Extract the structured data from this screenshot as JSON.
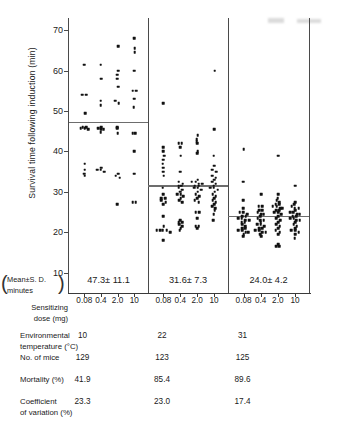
{
  "figure": {
    "ylabel": "Survival time following induction (min)",
    "y_axis": {
      "ticks": [
        70,
        60,
        50,
        40,
        30,
        20,
        10
      ],
      "min": 5,
      "max": 73
    },
    "x_axis": {
      "label_line1": "Sensitizing",
      "label_line2": "dose (mg)",
      "tick_labels": [
        "0.08",
        "0.4",
        "2.0",
        "10"
      ]
    },
    "mean_caption_line1": "Mean±S. D.",
    "mean_caption_line2": "minutes",
    "paren_left": "(",
    "paren_right": ")",
    "panels": [
      {
        "name": "10C",
        "mean_sd": "47.3± 11.1",
        "mean_value": 47.3
      },
      {
        "name": "22C",
        "mean_sd": "31.6± 7.3",
        "mean_value": 31.6
      },
      {
        "name": "31C",
        "mean_sd": "24.0± 4.2",
        "mean_value": 24.0
      }
    ]
  },
  "stats_table": {
    "rows": [
      {
        "label_line1": "Environmental",
        "label_line2": "temperature (°C)",
        "values": [
          "10",
          "22",
          "31"
        ]
      },
      {
        "label_line1": "No. of mice",
        "label_line2": "",
        "values": [
          "129",
          "123",
          "125"
        ]
      },
      {
        "label_line1": "Mortality (%)",
        "label_line2": "",
        "values": [
          "41.9",
          "85.4",
          "89.6"
        ]
      },
      {
        "label_line1": "Coefficient",
        "label_line2": "of variation (%)",
        "values": [
          "23.3",
          "23.0",
          "17.4"
        ]
      }
    ]
  },
  "chart_data": {
    "type": "scatter",
    "title": "",
    "xlabel": "Sensitizing dose (mg)",
    "ylabel": "Survival time following induction (min)",
    "ylim": [
      5,
      73
    ],
    "grid": false,
    "legend": "none",
    "groups": [
      {
        "environmental_temperature_C": 10,
        "mean": 47.3,
        "sd": 11.1,
        "n_mice": 129,
        "mortality_pct": 41.9,
        "cv_pct": 23.3,
        "doses": [
          {
            "dose_mg": 0.08,
            "values": [
              61.5,
              54.0,
              54.0,
              49.5,
              46.0,
              46.0,
              45.8,
              45.8,
              45.5,
              37.0,
              35.5,
              34.5,
              34.0
            ]
          },
          {
            "dose_mg": 0.4,
            "values": [
              61.5,
              58.0,
              52.5,
              51.5,
              46.0,
              45.8,
              45.5,
              45.5,
              44.8,
              36.0,
              35.5,
              35.5,
              35.0
            ]
          },
          {
            "dose_mg": 2.0,
            "values": [
              66.0,
              60.0,
              59.0,
              58.0,
              56.0,
              52.5,
              52.0,
              46.0,
              45.8,
              44.5,
              34.5,
              34.0,
              33.5,
              27.0
            ]
          },
          {
            "dose_mg": 10,
            "values": [
              68.0,
              65.5,
              64.5,
              60.0,
              55.0,
              55.0,
              53.0,
              51.0,
              44.5,
              44.5,
              40.0,
              34.5,
              27.5,
              27.5
            ]
          }
        ]
      },
      {
        "environmental_temperature_C": 22,
        "mean": 31.6,
        "sd": 7.3,
        "n_mice": 123,
        "mortality_pct": 85.4,
        "cv_pct": 23.0,
        "doses": [
          {
            "dose_mg": 0.08,
            "values": [
              52.0,
              41.0,
              40.0,
              39.0,
              38.0,
              37.0,
              36.0,
              35.0,
              34.0,
              31.0,
              29.5,
              28.5,
              28.5,
              28.0,
              27.5,
              27.0,
              24.0,
              21.5,
              20.5,
              20.5,
              20.5,
              20.5,
              20.0,
              18.0
            ]
          },
          {
            "dose_mg": 0.4,
            "values": [
              42.0,
              42.0,
              41.0,
              39.0,
              35.0,
              32.5,
              32.0,
              31.5,
              31.5,
              31.0,
              30.5,
              30.0,
              29.5,
              29.5,
              29.0,
              28.5,
              28.0,
              27.5,
              23.0,
              22.5,
              22.5,
              22.0,
              21.5,
              21.0,
              20.5
            ]
          },
          {
            "dose_mg": 2.0,
            "values": [
              44.0,
              43.0,
              42.5,
              42.0,
              40.0,
              39.5,
              33.0,
              32.5,
              32.5,
              32.0,
              32.0,
              31.5,
              31.5,
              31.0,
              31.0,
              30.5,
              30.0,
              29.5,
              29.0,
              28.5,
              28.0,
              27.5,
              25.0,
              25.0,
              23.5,
              21.5,
              21.5,
              21.0
            ]
          },
          {
            "dose_mg": 10,
            "values": [
              60.0,
              45.5,
              39.0,
              36.5,
              35.5,
              35.0,
              34.0,
              33.5,
              33.0,
              32.5,
              32.0,
              31.5,
              31.0,
              31.0,
              30.5,
              30.0,
              29.5,
              29.0,
              28.5,
              28.0,
              27.5,
              27.0,
              26.5,
              26.0,
              25.5,
              24.5,
              23.0
            ]
          }
        ]
      },
      {
        "environmental_temperature_C": 31,
        "mean": 24.0,
        "sd": 4.2,
        "n_mice": 125,
        "mortality_pct": 89.6,
        "cv_pct": 17.4,
        "doses": [
          {
            "dose_mg": 0.08,
            "values": [
              40.5,
              32.5,
              28.0,
              26.0,
              25.0,
              25.0,
              24.5,
              24.0,
              24.0,
              23.5,
              23.5,
              23.0,
              23.0,
              22.5,
              22.5,
              22.0,
              21.5,
              21.0,
              21.0,
              20.5,
              20.5,
              20.0,
              20.0,
              19.5,
              19.0
            ]
          },
          {
            "dose_mg": 0.4,
            "values": [
              29.5,
              26.5,
              26.5,
              25.5,
              25.5,
              25.0,
              24.5,
              24.5,
              24.0,
              23.5,
              23.0,
              23.0,
              22.5,
              22.0,
              22.0,
              21.5,
              21.0,
              21.0,
              20.5,
              20.5,
              20.0,
              20.0,
              19.5,
              19.0
            ]
          },
          {
            "dose_mg": 2.0,
            "values": [
              39.0,
              29.5,
              28.5,
              28.0,
              27.5,
              27.0,
              27.0,
              26.5,
              26.5,
              26.0,
              26.0,
              25.5,
              25.5,
              25.0,
              25.0,
              24.5,
              24.0,
              23.5,
              23.0,
              22.5,
              22.0,
              21.5,
              21.0,
              20.5,
              20.0,
              19.5,
              17.0,
              16.5,
              16.5
            ]
          },
          {
            "dose_mg": 10,
            "values": [
              31.5,
              27.5,
              27.0,
              26.5,
              26.0,
              26.0,
              25.5,
              25.0,
              25.0,
              24.5,
              24.5,
              24.0,
              24.0,
              23.5,
              23.5,
              23.0,
              23.0,
              22.5,
              22.0,
              21.5,
              21.0,
              20.5,
              20.5,
              20.0,
              19.5,
              18.5
            ]
          }
        ]
      }
    ]
  }
}
